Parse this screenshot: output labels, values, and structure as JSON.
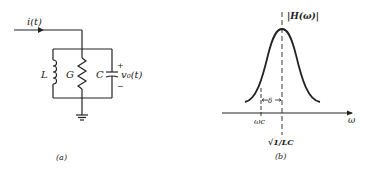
{
  "panel_a": {
    "current_label": "i(t)",
    "inductor_label": "L",
    "conductance_label": "G",
    "capacitor_label": "C",
    "voltage_label": "v₀(t)",
    "plus": "+",
    "minus": "−",
    "caption": "(a)"
  },
  "panel_b": {
    "y_label": "|H(ω)|",
    "x_label": "ω",
    "cutoff_label": "ωc",
    "center_label": "√1/LC",
    "delta_label": "δ",
    "caption": "(b)"
  }
}
